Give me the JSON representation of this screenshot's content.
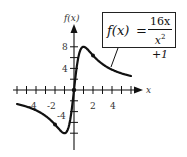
{
  "chart_data": {
    "type": "line",
    "function": "f(x) = 16x/(x^2+1)",
    "xlabel": "x",
    "ylabel": "f(x)",
    "xlim": [
      -6,
      6
    ],
    "ylim": [
      -9,
      9
    ],
    "x_ticks": [
      -6,
      -5,
      -4,
      -3,
      -2,
      -1,
      1,
      2,
      3,
      4,
      5,
      6
    ],
    "x_tick_labels": [
      "-4",
      "-2",
      "2",
      "4"
    ],
    "y_ticks": [
      -8,
      -6,
      -4,
      -2,
      2,
      4,
      6,
      8
    ],
    "y_tick_labels": [
      "8",
      "4",
      "-4"
    ],
    "grid": false,
    "legend": "none",
    "series": [
      {
        "name": "f(x)",
        "x": [
          -6,
          -5,
          -4,
          -3,
          -2,
          -1.5,
          -1,
          -0.5,
          0,
          0.5,
          1,
          1.5,
          2,
          3,
          4,
          5,
          6
        ],
        "values": [
          -2.59,
          -3.08,
          -3.76,
          -4.8,
          -6.4,
          -7.38,
          -8,
          -6.4,
          0,
          6.4,
          8,
          7.38,
          6.4,
          4.8,
          3.76,
          3.08,
          2.59
        ]
      }
    ],
    "annotations": [
      {
        "label": "local maximum",
        "x": 1,
        "y": 8
      },
      {
        "label": "local minimum",
        "x": -1,
        "y": -8
      },
      {
        "label": "marked point",
        "x": 2,
        "y": 6.4
      },
      {
        "label": "marked point",
        "x": -2,
        "y": -6.4
      }
    ]
  },
  "labels": {
    "y_axis": "f(x)",
    "x_axis": "x",
    "x_ticks": {
      "neg4": "-4",
      "neg2": "-2",
      "pos2": "2",
      "pos4": "4"
    },
    "y_ticks": {
      "pos8": "8",
      "pos4": "4",
      "neg4": "-4"
    }
  },
  "formula": {
    "lhs": "f(x)",
    "equals": "=",
    "numerator": "16x",
    "denominator_base": "x",
    "denominator_exp": "2",
    "denominator_rest": " +1"
  }
}
